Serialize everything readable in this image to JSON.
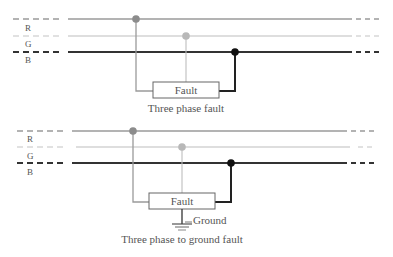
{
  "diagrams": [
    {
      "id": "three-phase",
      "phases": [
        {
          "label": "R",
          "y": 19,
          "color": "#9a9a9a",
          "width": 1.3,
          "dot_x": 136,
          "dot_color": "#8c8c8c"
        },
        {
          "label": "G",
          "y": 36,
          "color": "#bdbdbd",
          "width": 1.1,
          "dot_x": 186,
          "dot_color": "#b8b8b8"
        },
        {
          "label": "B",
          "y": 52,
          "color": "#333333",
          "width": 2,
          "dot_x": 235,
          "dot_color": "#111111"
        }
      ],
      "fault_box": {
        "x": 153,
        "y": 82,
        "w": 66,
        "h": 16,
        "label": "Fault"
      },
      "caption": "Three phase fault",
      "ground": null
    },
    {
      "id": "three-phase-ground",
      "phases": [
        {
          "label": "R",
          "y": 131,
          "color": "#9a9a9a",
          "width": 1.3,
          "dot_x": 133,
          "dot_color": "#8c8c8c"
        },
        {
          "label": "G",
          "y": 147,
          "color": "#bdbdbd",
          "width": 1.1,
          "dot_x": 182,
          "dot_color": "#b8b8b8"
        },
        {
          "label": "B",
          "y": 163,
          "color": "#333333",
          "width": 2,
          "dot_x": 231,
          "dot_color": "#111111"
        }
      ],
      "fault_box": {
        "x": 149,
        "y": 193,
        "w": 66,
        "h": 16,
        "label": "Fault"
      },
      "caption": "Three phase to ground fault",
      "ground": {
        "label": "Ground"
      }
    }
  ]
}
